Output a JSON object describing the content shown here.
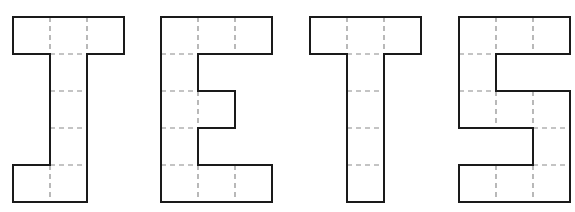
{
  "figure": {
    "word": "JETS",
    "cell_size_px": 37,
    "grid_cols": 3,
    "grid_rows": 5,
    "colors": {
      "outline": "#1a1a1a",
      "dashed_grid": "#8a8a8a",
      "background": "#ffffff"
    },
    "letters": [
      {
        "char": "J",
        "x": 13,
        "y": 17,
        "cells": [
          "###",
          ".#.",
          ".#.",
          ".#.",
          "##."
        ]
      },
      {
        "char": "E",
        "x": 161,
        "y": 17,
        "cells": [
          "###",
          "#..",
          "##.",
          "#..",
          "###"
        ]
      },
      {
        "char": "T",
        "x": 310,
        "y": 17,
        "cells": [
          "###",
          ".#.",
          ".#.",
          ".#.",
          ".#."
        ]
      },
      {
        "char": "S",
        "x": 459,
        "y": 17,
        "cells": [
          "###",
          "#..",
          "###",
          "..#",
          "###"
        ]
      }
    ]
  }
}
